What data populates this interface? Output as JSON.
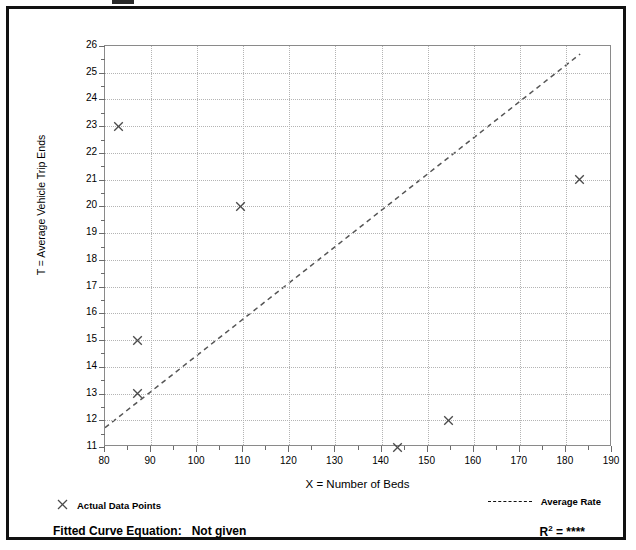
{
  "figure": {
    "background_color": "#ffffff",
    "frame_color": "#111111"
  },
  "chart_data": {
    "type": "scatter",
    "title": "",
    "xlabel": "X = Number of Beds",
    "ylabel": "T = Average Vehicle Trip Ends",
    "xlim": [
      80,
      190
    ],
    "ylim": [
      11,
      26
    ],
    "xticks": [
      80,
      90,
      100,
      110,
      120,
      130,
      140,
      150,
      160,
      170,
      180,
      190
    ],
    "yticks": [
      11,
      12,
      13,
      14,
      15,
      16,
      17,
      18,
      19,
      20,
      21,
      22,
      23,
      24,
      25,
      26
    ],
    "grid": true,
    "legend_position": "below-axes",
    "series": [
      {
        "name": "Actual Data Points",
        "type": "scatter",
        "marker": "x",
        "color": "#4a4a4a",
        "points": [
          {
            "x": 83.0,
            "y": 23.0
          },
          {
            "x": 87.0,
            "y": 15.0
          },
          {
            "x": 87.0,
            "y": 13.0
          },
          {
            "x": 109.5,
            "y": 20.0
          },
          {
            "x": 143.5,
            "y": 11.0
          },
          {
            "x": 154.5,
            "y": 12.0
          },
          {
            "x": 183.0,
            "y": 21.0
          }
        ]
      },
      {
        "name": "Average Rate",
        "type": "line",
        "style": "dashed",
        "color": "#555555",
        "endpoints": [
          {
            "x": 80.0,
            "y": 11.65
          },
          {
            "x": 183.5,
            "y": 25.7
          }
        ]
      }
    ],
    "annotations": {
      "fitted_curve_label": "Fitted Curve Equation:",
      "fitted_curve_value": "Not given",
      "r_squared_label": "R",
      "r_squared_exponent": "2",
      "r_squared_equals": "=",
      "r_squared_value": "****"
    }
  },
  "legend": {
    "actual_points_marker": "x-marker-icon",
    "actual_points_label": "Actual Data Points",
    "average_rate_marker": "dashed-line-icon",
    "average_rate_label": "Average Rate"
  },
  "axes": {
    "x_title": "X = Number of Beds",
    "y_title": "T = Average Vehicle Trip Ends",
    "x_tick_labels": [
      "80",
      "90",
      "100",
      "110",
      "120",
      "130",
      "140",
      "150",
      "160",
      "170",
      "180",
      "190"
    ],
    "y_tick_labels": [
      "11",
      "12",
      "13",
      "14",
      "15",
      "16",
      "17",
      "18",
      "19",
      "20",
      "21",
      "22",
      "23",
      "24",
      "25",
      "26"
    ]
  }
}
